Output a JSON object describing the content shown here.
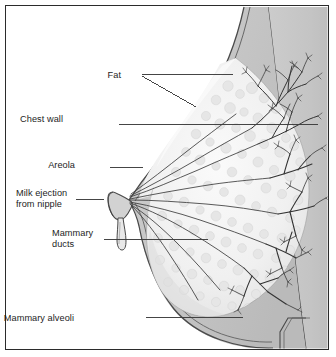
{
  "figure": {
    "kind": "anatomical-illustration",
    "orientation": "Nipple to the left, chest wall to the right",
    "frame": {
      "border_color": "#2b2b2b",
      "background": "#ffffff"
    }
  },
  "palette": {
    "background": "#ffffff",
    "border": "#2b2b2b",
    "skin_line": "#4a4a4a",
    "fat_fill": "#c6c6c6",
    "fat_fill_dark": "#bdbdbd",
    "chest_wall_fill": "#c9c9c9",
    "gland_fill": "#f2f2f2",
    "gland_shade": "#e4e4e4",
    "alveoli_bubble": "#ededed",
    "duct_line": "#3a3a3a",
    "leader_line": "#3b3b3b",
    "label_text": "#1d1d1d"
  },
  "labels": [
    {
      "id": "fat",
      "name": "Fat",
      "lines": [
        "Fat"
      ],
      "text_x": 121,
      "text_y": 70,
      "align": "right",
      "leaders": [
        {
          "type": "horizontal",
          "x1": 142,
          "y1": 74,
          "x2": 233,
          "y2": 74
        },
        {
          "type": "diagonal",
          "x1": 142,
          "y1": 76,
          "x2": 196,
          "y2": 107
        }
      ]
    },
    {
      "id": "chest-wall",
      "name": "Chest wall",
      "lines": [
        "Chest wall"
      ],
      "text_x": 63,
      "text_y": 114,
      "align": "right",
      "leaders": [
        {
          "type": "horizontal",
          "x1": 119,
          "y1": 124,
          "x2": 318,
          "y2": 124
        }
      ]
    },
    {
      "id": "areola",
      "name": "Areola",
      "lines": [
        "Areola"
      ],
      "text_x": 75,
      "text_y": 160,
      "align": "right",
      "leaders": [
        {
          "type": "horizontal",
          "x1": 110,
          "y1": 167,
          "x2": 143,
          "y2": 167
        }
      ]
    },
    {
      "id": "milk-ejection",
      "name": "Milk ejection from nipple",
      "lines": [
        "Milk ejection",
        "from nipple"
      ],
      "text_x": 16,
      "text_y": 188,
      "align": "left",
      "leaders": [
        {
          "type": "horizontal",
          "x1": 76,
          "y1": 199,
          "x2": 104,
          "y2": 199
        }
      ]
    },
    {
      "id": "mammary-ducts",
      "name": "Mammary ducts",
      "lines": [
        "Mammary",
        "ducts"
      ],
      "text_x": 52,
      "text_y": 228,
      "align": "left",
      "leaders": [
        {
          "type": "horizontal",
          "x1": 104,
          "y1": 239,
          "x2": 208,
          "y2": 239
        }
      ]
    },
    {
      "id": "mammary-alveoli",
      "name": "Mammary alveoli",
      "lines": [
        "Mammary alveoli"
      ],
      "text_x": 74,
      "text_y": 313,
      "align": "right",
      "leaders": [
        {
          "type": "horizontal",
          "x1": 146,
          "y1": 317,
          "x2": 243,
          "y2": 317
        }
      ]
    }
  ],
  "structures": [
    {
      "id": "skin",
      "name": "Skin surface"
    },
    {
      "id": "fat-layer",
      "name": "Subcutaneous fat layer"
    },
    {
      "id": "chest-wall",
      "name": "Chest wall"
    },
    {
      "id": "glandular-mass",
      "name": "Glandular tissue mass"
    },
    {
      "id": "nipple",
      "name": "Nipple"
    },
    {
      "id": "areola",
      "name": "Areola"
    },
    {
      "id": "milk-drop",
      "name": "Milk droplet ejecting from nipple"
    },
    {
      "id": "lactiferous-sinuses",
      "name": "Lactiferous sinuses converging at nipple"
    },
    {
      "id": "duct-tree",
      "name": "Mammary duct branching tree"
    },
    {
      "id": "alveoli-clusters",
      "name": "Mammary alveoli clusters"
    },
    {
      "id": "inframammary-fold",
      "name": "Inframammary fold at lower chest wall"
    }
  ]
}
